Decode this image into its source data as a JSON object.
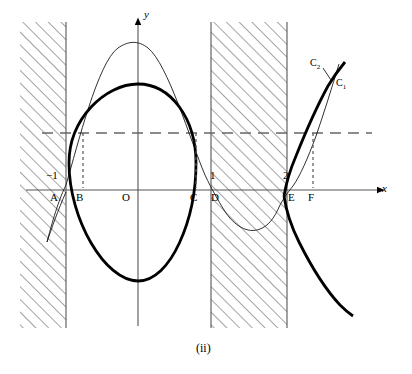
{
  "figure": {
    "caption": "(ii)",
    "axes": {
      "x_label": "x",
      "y_label": "y"
    },
    "colors": {
      "stroke": "#000000",
      "hatch": "#555555",
      "dashed": "#666666",
      "thin_curve": "#222222",
      "thick_curve": "#000000",
      "boundary": "#666666"
    },
    "point_labels": [
      {
        "name": "A",
        "text": "A",
        "x": 52,
        "y": 195
      },
      {
        "name": "B",
        "text": "B",
        "x": 77,
        "y": 195
      },
      {
        "name": "O",
        "text": "O",
        "x": 124,
        "y": 195
      },
      {
        "name": "C",
        "text": "C",
        "x": 190,
        "y": 195
      },
      {
        "name": "D",
        "text": "D",
        "x": 212,
        "y": 195
      },
      {
        "name": "E",
        "text": "E",
        "x": 289,
        "y": 195
      },
      {
        "name": "F",
        "text": "F",
        "x": 309,
        "y": 195
      }
    ],
    "tick_labels": [
      {
        "name": "minus-one",
        "text": "−1",
        "x": 52,
        "y": 177
      },
      {
        "name": "one",
        "text": "1",
        "x": 212,
        "y": 177
      },
      {
        "name": "two",
        "text": "2",
        "x": 285,
        "y": 177
      }
    ],
    "curve_labels": [
      {
        "name": "C2",
        "base": "C",
        "sub": "2",
        "x": 313,
        "y": 63
      },
      {
        "name": "C1",
        "base": "C",
        "sub": "1",
        "x": 338,
        "y": 83
      }
    ]
  }
}
